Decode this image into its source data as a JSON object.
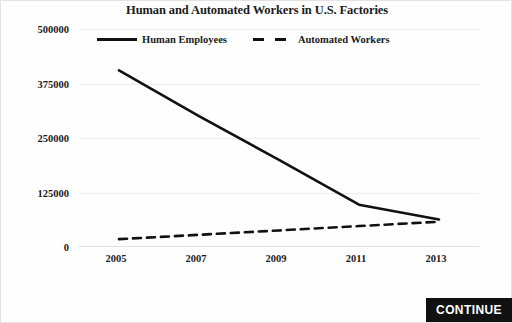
{
  "chart_data": {
    "type": "line",
    "title": "Human and Automated Workers in U.S. Factories",
    "xlabel": "",
    "ylabel": "",
    "x": [
      2005,
      2007,
      2009,
      2011,
      2013
    ],
    "xtick_labels": [
      "2005",
      "2007",
      "2009",
      "2011",
      "2013"
    ],
    "ytick_labels": [
      "0",
      "125000",
      "250000",
      "375000",
      "500000"
    ],
    "ytick_values": [
      0,
      125000,
      250000,
      375000,
      500000
    ],
    "ylim": [
      0,
      500000
    ],
    "xlim": [
      2004,
      2014
    ],
    "grid": true,
    "legend_position": "top-center",
    "series": [
      {
        "name": "Human Employees",
        "style": "solid",
        "color": "#111111",
        "values": [
          405000,
          300000,
          200000,
          97000,
          63000
        ]
      },
      {
        "name": "Automated Workers",
        "style": "dashed",
        "color": "#111111",
        "values": [
          18000,
          28000,
          38000,
          48000,
          58000
        ]
      }
    ]
  },
  "footer": {
    "continue_label": "CONTINUE"
  }
}
